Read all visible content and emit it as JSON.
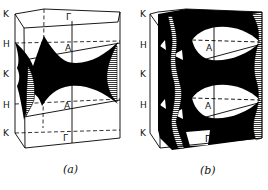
{
  "figure": {
    "panels": [
      {
        "id": "a",
        "caption": "(a)",
        "side_labels": [
          "K",
          "H",
          "K",
          "H",
          "K"
        ],
        "interior_labels": {
          "top_center": "Γ",
          "upper_mid": "A",
          "lower_mid": "A",
          "bottom_center": "Γ"
        }
      },
      {
        "id": "b",
        "caption": "(b)",
        "side_labels": [
          "K",
          "H",
          "K",
          "H",
          "K"
        ],
        "interior_labels": {
          "upper_mid": "A",
          "lower_mid": "A",
          "bottom_center": "Γ"
        }
      }
    ],
    "colors": {
      "ink": "#000000",
      "paper": "#ffffff",
      "hatch": "#555555"
    }
  }
}
